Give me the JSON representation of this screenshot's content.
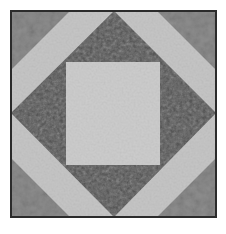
{
  "image": {
    "title": "Geometric quilt block pattern",
    "width": 226,
    "height": 234,
    "canvas_background": "#ffffff"
  },
  "frame": {
    "name": "outer-border",
    "stroke_color": "#2b2b2b",
    "stroke_width": 2,
    "x": 10,
    "y": 10,
    "width": 207,
    "height": 208
  },
  "palette": {
    "background_gray": "#8e8e8e",
    "background_gray_dark": "#7d7d7d",
    "background_gray_light": "#9d9d9d",
    "dark_diamond": "#4d4d4d",
    "dark_diamond_shade": "#565656",
    "light_band": "#c6c6c6",
    "center_square": "#cdcdcd",
    "border": "#2b2b2b",
    "page": "#ffffff"
  },
  "chart_data": {
    "type": "diagram",
    "layers": [
      {
        "name": "background-field",
        "shape": "square",
        "fill": "#8e8e8e",
        "texture": "mottled noise",
        "points": "11,11 216,11 216,217 11,217"
      },
      {
        "name": "light-octagon",
        "shape": "octagon",
        "fill": "#c6c6c6",
        "points": "70,11 157,11 216,70 216,158 157,217 70,217 11,158 11,70"
      },
      {
        "name": "dark-diamond",
        "shape": "diamond",
        "fill": "#4d4d4d",
        "points": "114,11 216,113 114,217 11,113"
      },
      {
        "name": "center-square",
        "shape": "square",
        "fill": "#cdcdcd",
        "points": "66,62 160,62 160,165 66,165"
      }
    ]
  },
  "labels": {
    "background_field": "mottled-gray-field",
    "octagon": "light-gray-octagon",
    "diamond": "dark-gray-diamond",
    "center": "light-gray-center-square"
  }
}
